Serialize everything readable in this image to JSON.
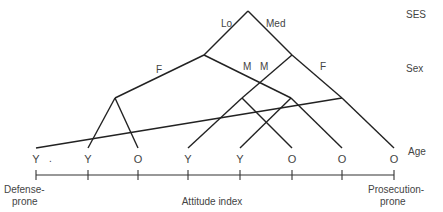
{
  "diagram": {
    "type": "tree",
    "levels": [
      {
        "label": "SES",
        "x": 406,
        "y": 18
      },
      {
        "label": "Sex",
        "x": 406,
        "y": 72
      },
      {
        "label": "Age",
        "x": 408,
        "y": 155
      }
    ],
    "branch_labels": [
      {
        "id": "lo",
        "text": "Lo",
        "x": 221,
        "y": 27
      },
      {
        "id": "med",
        "text": "Med",
        "x": 266,
        "y": 27
      },
      {
        "id": "f_lo",
        "text": "F",
        "x": 156,
        "y": 73
      },
      {
        "id": "m_lo",
        "text": "M",
        "x": 243,
        "y": 70
      },
      {
        "id": "m_med",
        "text": "M",
        "x": 260,
        "y": 70
      },
      {
        "id": "f_med",
        "text": "F",
        "x": 320,
        "y": 70
      }
    ],
    "nodes": {
      "root": [
        248,
        11
      ],
      "lo": [
        204,
        55
      ],
      "med": [
        292,
        55
      ],
      "lo_f": [
        115,
        98
      ],
      "lo_m": [
        291,
        98
      ],
      "med_m": [
        242,
        98
      ],
      "med_f": [
        342,
        98
      ]
    },
    "edges": [
      [
        [
          248,
          11
        ],
        [
          204,
          55
        ]
      ],
      [
        [
          248,
          11
        ],
        [
          292,
          55
        ]
      ],
      [
        [
          204,
          55
        ],
        [
          115,
          98
        ]
      ],
      [
        [
          204,
          55
        ],
        [
          291,
          98
        ]
      ],
      [
        [
          292,
          55
        ],
        [
          242,
          98
        ]
      ],
      [
        [
          292,
          55
        ],
        [
          342,
          98
        ]
      ],
      [
        [
          115,
          98
        ],
        [
          88,
          148
        ]
      ],
      [
        [
          115,
          98
        ],
        [
          138,
          148
        ]
      ],
      [
        [
          242,
          98
        ],
        [
          188,
          148
        ]
      ],
      [
        [
          242,
          98
        ],
        [
          292,
          148
        ]
      ],
      [
        [
          291,
          98
        ],
        [
          240,
          148
        ]
      ],
      [
        [
          291,
          98
        ],
        [
          342,
          148
        ]
      ],
      [
        [
          342,
          98
        ],
        [
          394,
          148
        ]
      ],
      [
        [
          342,
          98
        ],
        [
          36,
          148
        ]
      ]
    ],
    "leaves": [
      {
        "label": "Y",
        "x": 36
      },
      {
        "label": "Y",
        "x": 88
      },
      {
        "label": "O",
        "x": 138
      },
      {
        "label": "Y",
        "x": 188
      },
      {
        "label": "Y",
        "x": 240
      },
      {
        "label": "O",
        "x": 292
      },
      {
        "label": "O",
        "x": 342
      },
      {
        "label": "O",
        "x": 394
      }
    ],
    "leaf_y": 163,
    "stray_dot": {
      "text": ".",
      "x": 49,
      "y": 162
    },
    "axis": {
      "y": 175,
      "x_start": 36,
      "x_end": 394,
      "tick_xs": [
        36,
        88,
        138,
        188,
        240,
        292,
        342,
        394
      ],
      "title": "Attitude index",
      "left_label_line1": "Defense-",
      "left_label_line2": "prone",
      "right_label_line1": "Prosecution-",
      "right_label_line2": "prone"
    }
  }
}
